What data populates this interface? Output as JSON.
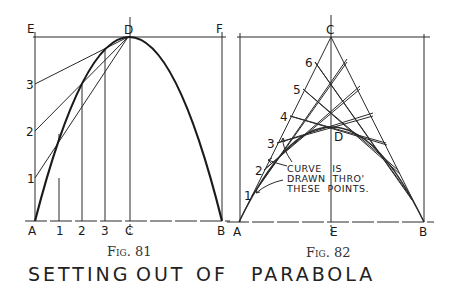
{
  "figure81": {
    "caption": "Fig. 81",
    "labels": {
      "E": "E",
      "D": "D",
      "F": "F",
      "A": "A",
      "C": "C",
      "B": "B",
      "base_1": "1",
      "base_2": "2",
      "base_3": "3",
      "side_1": "1",
      "side_2": "2",
      "side_3": "3"
    }
  },
  "figure82": {
    "caption": "Fig. 82",
    "labels": {
      "C": "C",
      "D": "D",
      "A": "A",
      "E": "E",
      "B": "B",
      "m1": "1",
      "m2": "2",
      "m3": "3",
      "m4": "4",
      "m5": "5",
      "m6": "6"
    },
    "annotation": {
      "line1": "CURVE   IS",
      "line2": "DRAWN  THRO'",
      "line3": "THESE  POINTS."
    }
  },
  "title": "SETTING OUT OF PARABOLA",
  "title_parts": [
    "SETTING",
    "OUT",
    "OF",
    "PARABOLA"
  ]
}
